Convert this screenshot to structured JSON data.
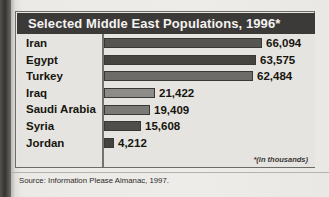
{
  "chart_data": {
    "type": "bar",
    "orientation": "horizontal",
    "title": "Selected Middle East Populations, 1996*",
    "footnote": "*(in thousands)",
    "source": "Source: Information Please Almanac, 1997.",
    "xlabel": "",
    "ylabel": "",
    "grid": false,
    "legend": "none",
    "units": "thousands",
    "xlim": [
      0,
      70000
    ],
    "categories": [
      "Iran",
      "Egypt",
      "Turkey",
      "Iraq",
      "Saudi Arabia",
      "Syria",
      "Jordan"
    ],
    "values": [
      66094,
      63575,
      62484,
      21422,
      19409,
      15608,
      4212
    ],
    "value_labels": [
      "66,094",
      "63,575",
      "62,484",
      "21,422",
      "19,409",
      "15,608",
      "4,212"
    ],
    "bars": [
      {
        "label": "Iran",
        "value": 66094,
        "value_label": "66,094",
        "color": "#575552",
        "width_px": 158
      },
      {
        "label": "Egypt",
        "value": 63575,
        "value_label": "63,575",
        "color": "#46443f",
        "width_px": 152
      },
      {
        "label": "Turkey",
        "value": 62484,
        "value_label": "62,484",
        "color": "#6e6c68",
        "width_px": 149
      },
      {
        "label": "Iraq",
        "value": 21422,
        "value_label": "21,422",
        "color": "#8e8c88",
        "width_px": 51
      },
      {
        "label": "Saudi Arabia",
        "value": 19409,
        "value_label": "19,409",
        "color": "#7b7975",
        "width_px": 46
      },
      {
        "label": "Syria",
        "value": 15608,
        "value_label": "15,608",
        "color": "#504e4a",
        "width_px": 37
      },
      {
        "label": "Jordan",
        "value": 4212,
        "value_label": "4,212",
        "color": "#45433f",
        "width_px": 10
      }
    ]
  },
  "colors": {
    "title_band": "#3c3a38",
    "title_text": "#f4f3f1",
    "plot_background": "#e6e4e0",
    "frame_border": "#6d6b67",
    "axis_line": "#74726e",
    "label_text": "#16150f"
  }
}
